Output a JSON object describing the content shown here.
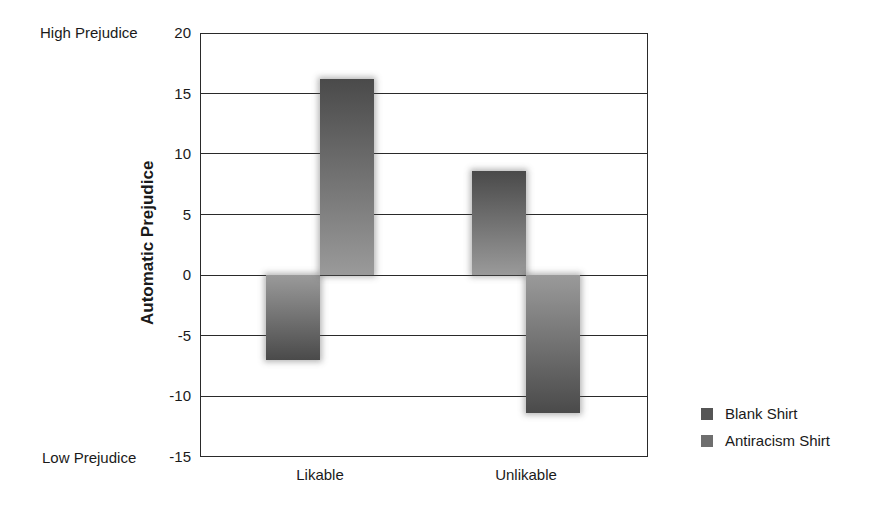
{
  "chart_data": {
    "type": "bar",
    "title": "",
    "xlabel": "",
    "ylabel": "Automatic Prejudice",
    "ylim": [
      -15,
      20
    ],
    "yticks": [
      20,
      15,
      10,
      5,
      0,
      -5,
      -10,
      -15
    ],
    "ytick_labels": [
      "20",
      "15",
      "10",
      "5",
      "0",
      "-5",
      "-10",
      "-15"
    ],
    "categories": [
      "Likable",
      "Unlikable"
    ],
    "series": [
      {
        "name": "Blank Shirt",
        "values": [
          -7.0,
          8.6
        ]
      },
      {
        "name": "Antiracism Shirt",
        "values": [
          16.2,
          -11.4
        ]
      }
    ],
    "annotations": {
      "high": "High Prejudice",
      "low": "Low Prejudice"
    },
    "grid": true,
    "legend_position": "bottom-right"
  },
  "colors": {
    "bar_dark": "#4a4a4a",
    "bar_light": "#9a9a9a",
    "legend_blank": "#555555",
    "legend_antiracism": "#6e6e6e",
    "axis": "#2a2a2a"
  }
}
